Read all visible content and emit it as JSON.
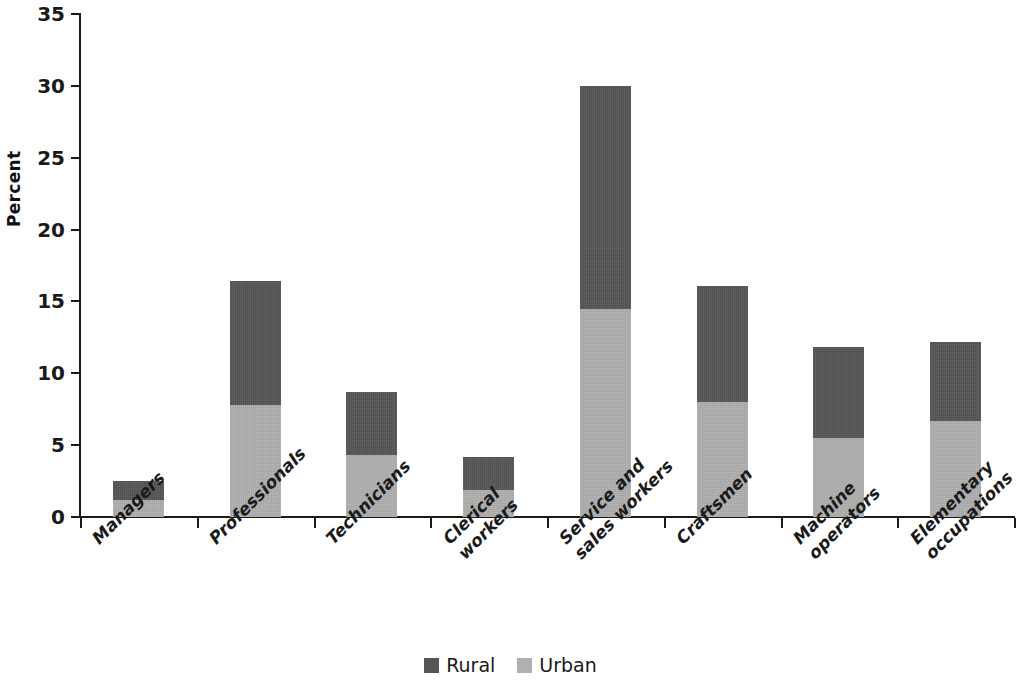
{
  "chart_data": {
    "type": "bar",
    "subtype": "stacked-vertical",
    "title": "",
    "xlabel": "",
    "ylabel": "Percent",
    "ylim": [
      0,
      35
    ],
    "yticks": [
      0,
      5,
      10,
      15,
      20,
      25,
      30,
      35
    ],
    "grid": false,
    "legend_position": "bottom-center",
    "categories": [
      "Managers",
      "Professionals",
      "Technicians",
      "Clerical workers",
      "Service and sales workers",
      "Craftsmen",
      "Machine operators",
      "Elementary occupations"
    ],
    "category_label_lines": [
      [
        "Managers"
      ],
      [
        "Professionals"
      ],
      [
        "Technicians"
      ],
      [
        "Clerical",
        "workers"
      ],
      [
        "Service and",
        "sales workers"
      ],
      [
        "Craftsmen"
      ],
      [
        "Machine",
        "operators"
      ],
      [
        "Elementary",
        "occupations"
      ]
    ],
    "series": [
      {
        "name": "Urban",
        "color": "#b0b0b0",
        "values": [
          1.2,
          7.8,
          4.3,
          1.9,
          14.5,
          8.0,
          5.5,
          6.7
        ]
      },
      {
        "name": "Rural",
        "color": "#555555",
        "values": [
          1.3,
          8.6,
          4.4,
          2.3,
          15.5,
          8.1,
          6.3,
          5.5
        ]
      }
    ],
    "totals": [
      2.5,
      16.4,
      8.7,
      4.2,
      30.0,
      16.1,
      11.8,
      12.2
    ],
    "stack_order_bottom_to_top": [
      "Urban",
      "Rural"
    ]
  },
  "axis": {
    "y_title": "Percent",
    "y_tick_labels": [
      "0",
      "5",
      "10",
      "15",
      "20",
      "25",
      "30",
      "35"
    ]
  },
  "legend": {
    "items": [
      {
        "label": "Rural",
        "color": "#555555"
      },
      {
        "label": "Urban",
        "color": "#b0b0b0"
      }
    ]
  },
  "colors": {
    "rural": "#555555",
    "urban": "#b0b0b0",
    "axis": "#1a1a1a",
    "background": "#ffffff"
  }
}
